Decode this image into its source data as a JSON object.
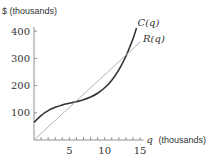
{
  "chart_data": {
    "type": "line",
    "title": "",
    "xlabel": "q (thousands)",
    "xlabel_var": "q",
    "xlabel_unit": "(thousands)",
    "ylabel": "$ (thousands)",
    "xlim": [
      0,
      15.5
    ],
    "ylim": [
      0,
      430
    ],
    "x_ticks": [
      5,
      10,
      15
    ],
    "x_tick_labels": [
      "5",
      "10",
      "15"
    ],
    "x_minor_tick_step": 1,
    "y_ticks": [
      100,
      200,
      300,
      400
    ],
    "y_tick_labels": [
      "100",
      "200",
      "300",
      "400"
    ],
    "grid": false,
    "series": [
      {
        "name": "C(q)",
        "label": "C(q)",
        "color": "#333333",
        "x": [
          0,
          1,
          2,
          3,
          4,
          5,
          6,
          7,
          8,
          9,
          10,
          11,
          12,
          13,
          14,
          14.5
        ],
        "values": [
          65,
          90,
          108,
          120,
          129,
          135,
          141,
          148,
          158,
          172,
          192,
          220,
          258,
          308,
          372,
          412
        ]
      },
      {
        "name": "R(q)",
        "label": "R(q)",
        "color": "#aaaaaa",
        "x": [
          0,
          15
        ],
        "values": [
          0,
          360
        ]
      }
    ]
  }
}
